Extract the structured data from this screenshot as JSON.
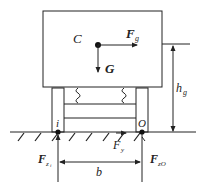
{
  "diagram": {
    "labels": {
      "center": "C",
      "force_g": "F",
      "force_g_sub": "g",
      "gravity": "G",
      "height": "h",
      "height_sub": "g",
      "point_inner": "i",
      "point_outer": "O",
      "force_y": "F",
      "force_y_sub": "y",
      "force_zi": "F",
      "force_zi_sub": "z",
      "force_zi_sub2": "i",
      "force_zo": "F",
      "force_zo_sub": "zO",
      "track": "b"
    },
    "colors": {
      "line": "#222222",
      "background": "#ffffff"
    }
  }
}
